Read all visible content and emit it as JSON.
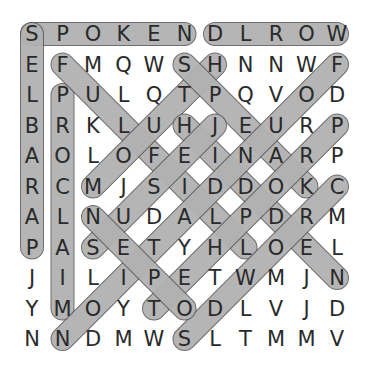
{
  "puzzle": {
    "rows": 11,
    "cols": 11,
    "grid": [
      [
        "S",
        "P",
        "O",
        "K",
        "E",
        "N",
        "D",
        "L",
        "R",
        "O",
        "W"
      ],
      [
        "E",
        "F",
        "M",
        "Q",
        "W",
        "S",
        "H",
        "N",
        "N",
        "W",
        "F"
      ],
      [
        "L",
        "P",
        "U",
        "L",
        "Q",
        "T",
        "P",
        "Q",
        "V",
        "O",
        "D"
      ],
      [
        "B",
        "R",
        "K",
        "L",
        "U",
        "H",
        "J",
        "E",
        "U",
        "R",
        "P"
      ],
      [
        "A",
        "O",
        "L",
        "O",
        "F",
        "E",
        "I",
        "N",
        "A",
        "R",
        "P"
      ],
      [
        "R",
        "C",
        "M",
        "J",
        "S",
        "I",
        "D",
        "D",
        "O",
        "K",
        "C"
      ],
      [
        "A",
        "L",
        "N",
        "U",
        "D",
        "A",
        "L",
        "P",
        "D",
        "R",
        "M"
      ],
      [
        "P",
        "A",
        "S",
        "E",
        "T",
        "Y",
        "H",
        "L",
        "O",
        "E",
        "L"
      ],
      [
        "J",
        "I",
        "L",
        "I",
        "P",
        "E",
        "T",
        "W",
        "M",
        "J",
        "N"
      ],
      [
        "Y",
        "M",
        "O",
        "Y",
        "T",
        "O",
        "D",
        "L",
        "V",
        "J",
        "D"
      ],
      [
        "N",
        "N",
        "D",
        "M",
        "W",
        "S",
        "L",
        "T",
        "M",
        "M",
        "V"
      ]
    ],
    "found_words": [
      {
        "word": "SPOKEN",
        "start": [
          0,
          0
        ],
        "end": [
          0,
          5
        ]
      },
      {
        "word": "WORLD",
        "start": [
          0,
          10
        ],
        "end": [
          0,
          6
        ]
      },
      {
        "word": "PARABLES",
        "start": [
          7,
          0
        ],
        "end": [
          0,
          0
        ]
      },
      {
        "word": "PROCLAIM",
        "start": [
          2,
          1
        ],
        "end": [
          9,
          1
        ]
      },
      {
        "word": "FULFILL",
        "start": [
          1,
          1
        ],
        "end": [
          7,
          7
        ]
      },
      {
        "word": "MOUTH",
        "start": [
          5,
          2
        ],
        "end": [
          1,
          6
        ]
      },
      {
        "word": "SPEAK",
        "start": [
          1,
          5
        ],
        "end": [
          5,
          9
        ]
      },
      {
        "word": "HIDDEN",
        "start": [
          3,
          5
        ],
        "end": [
          8,
          10
        ]
      },
      {
        "word": "JESUS",
        "start": [
          3,
          6
        ],
        "end": [
          7,
          2
        ]
      },
      {
        "word": "FOUNDATION",
        "start": [
          1,
          10
        ],
        "end": [
          10,
          1
        ]
      },
      {
        "word": "PROPHET",
        "start": [
          3,
          10
        ],
        "end": [
          9,
          4
        ]
      },
      {
        "word": "CROWDS",
        "start": [
          5,
          10
        ],
        "end": [
          10,
          5
        ]
      },
      {
        "word": "OPEN",
        "start": [
          9,
          5
        ],
        "end": [
          6,
          2
        ]
      }
    ],
    "colors": {
      "highlight_fill": "#d3d3d3",
      "highlight_stroke": "#555555",
      "letter": "#2a2a2a",
      "background": "#ffffff"
    }
  }
}
